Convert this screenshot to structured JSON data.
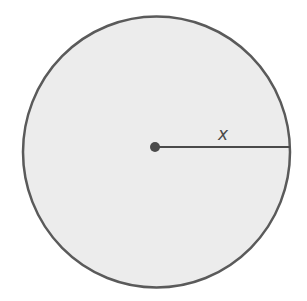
{
  "diagram": {
    "shape": "circle",
    "fill_color": "#ececec",
    "stroke_color": "#5a5a5a",
    "radius_label": "x",
    "center_point": "center-dot",
    "elements": [
      "circle",
      "center point",
      "radius line",
      "radius label"
    ]
  }
}
